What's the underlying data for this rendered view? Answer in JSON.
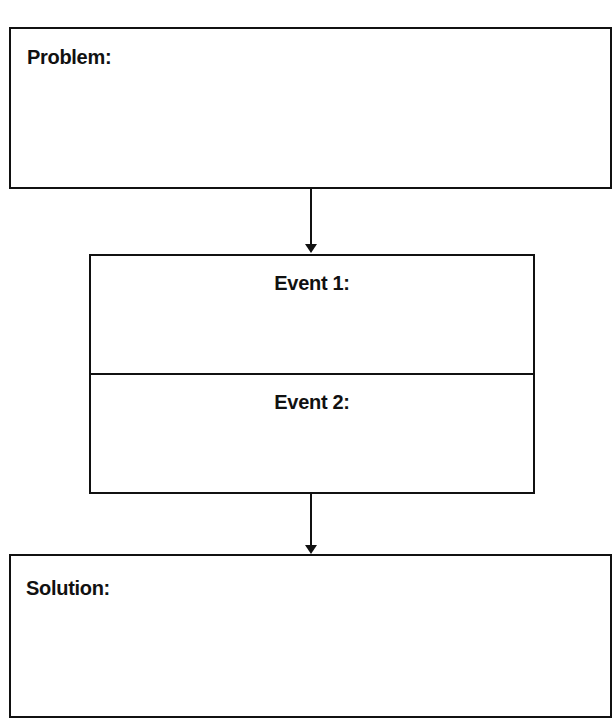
{
  "diagram": {
    "type": "problem-solution-flowchart",
    "problem": {
      "label": "Problem:",
      "content": ""
    },
    "events": [
      {
        "label": "Event 1:",
        "content": ""
      },
      {
        "label": "Event 2:",
        "content": ""
      }
    ],
    "solution": {
      "label": "Solution:",
      "content": ""
    },
    "connectors": [
      {
        "from": "problem",
        "to": "events",
        "style": "arrow-down"
      },
      {
        "from": "events",
        "to": "solution",
        "style": "arrow-down"
      }
    ],
    "colors": {
      "stroke": "#111111",
      "background": "#ffffff",
      "text": "#111111"
    }
  }
}
